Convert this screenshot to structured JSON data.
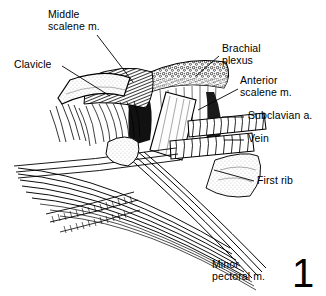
{
  "figure": {
    "number": "1",
    "kind": "anatomical-line-illustration",
    "style": "pen-and-ink hatched medical illustration, black on white",
    "background_color": "#ffffff",
    "ink_color": "#000000"
  },
  "labels": [
    {
      "id": "middle-scalene",
      "text": "Middle\nscalene m.",
      "lines": [
        "Middle",
        "scalene m."
      ],
      "leader": "diagonal-down-right"
    },
    {
      "id": "clavicle",
      "text": "Clavicle",
      "lines": [
        "Clavicle"
      ],
      "leader": "diagonal-down-right"
    },
    {
      "id": "brachial-plexus",
      "text": "Brachial\nplexus",
      "lines": [
        "Brachial",
        "plexus"
      ],
      "leader": "diagonal-down-left"
    },
    {
      "id": "anterior-scalene",
      "text": "Anterior\nscalene m.",
      "lines": [
        "Anterior",
        "scalene m."
      ],
      "leader": "diagonal-down-left"
    },
    {
      "id": "subclavian-a",
      "text": "Subclavian a.",
      "lines": [
        "Subclavian a."
      ],
      "leader": "horizontal-left"
    },
    {
      "id": "vein",
      "text": "Vein",
      "lines": [
        "Vein"
      ],
      "leader": "horizontal-left"
    },
    {
      "id": "first-rib",
      "text": "First rib",
      "lines": [
        "First rib"
      ],
      "leader": "diagonal-up-left"
    },
    {
      "id": "minor-pectoral",
      "text": "Minor\npectoral m.",
      "lines": [
        "Minor",
        "pectoral m."
      ],
      "leader": "none"
    }
  ],
  "structures": [
    {
      "id": "clavicle-bone",
      "name": "clavicle",
      "rendering": "pale stippled diagonal bone shaft"
    },
    {
      "id": "middle-scalene-m",
      "name": "middle scalene muscle",
      "rendering": "hatched muscle belly, upper center"
    },
    {
      "id": "anterior-scalene-m",
      "name": "anterior scalene muscle",
      "rendering": "pale triangular wedge, center"
    },
    {
      "id": "brachial-plexus-n",
      "name": "brachial plexus",
      "rendering": "stippled nodular nerve cords, upper right"
    },
    {
      "id": "subclavian-artery",
      "name": "subclavian artery",
      "rendering": "banded cylindrical vessel, right"
    },
    {
      "id": "subclavian-vein",
      "name": "subclavian vein",
      "rendering": "banded cylindrical vessel below artery"
    },
    {
      "id": "first-rib-bone",
      "name": "first rib",
      "rendering": "stippled flat bone, lower right"
    },
    {
      "id": "pectoralis-minor",
      "name": "pectoralis minor muscle",
      "rendering": "long converging fiber bundles, lower"
    }
  ]
}
